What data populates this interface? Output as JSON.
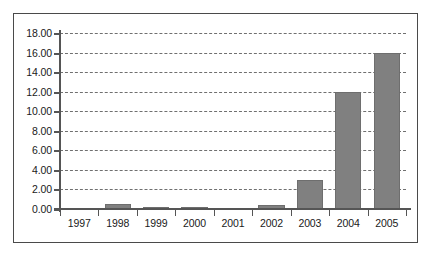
{
  "chart_data": {
    "type": "bar",
    "title": "",
    "xlabel": "",
    "ylabel": "",
    "categories": [
      "1997",
      "1998",
      "1999",
      "2000",
      "2001",
      "2002",
      "2003",
      "2004",
      "2005"
    ],
    "values": [
      0.0,
      0.55,
      0.25,
      0.12,
      0.02,
      0.4,
      3.0,
      12.0,
      16.0
    ],
    "ylim": [
      0.0,
      18.0
    ],
    "ytick_step": 2.0,
    "ytick_labels": [
      "18.00",
      "16.00",
      "14.00",
      "12.00",
      "10.00",
      "8.00",
      "6.00",
      "4.00",
      "2.00",
      "0.00"
    ],
    "ytick_values": [
      18.0,
      16.0,
      14.0,
      12.0,
      10.0,
      8.0,
      6.0,
      4.0,
      2.0,
      0.0
    ],
    "grid": true,
    "grid_style": "dashed-horizontal",
    "legend": false,
    "legend_position": "none",
    "bar_color": "#808080",
    "axis_color": "#555555",
    "grid_color": "#707070",
    "border_color": "#4a4a4a",
    "background_color": "#ffffff",
    "text_color": "#1a1a1a"
  }
}
